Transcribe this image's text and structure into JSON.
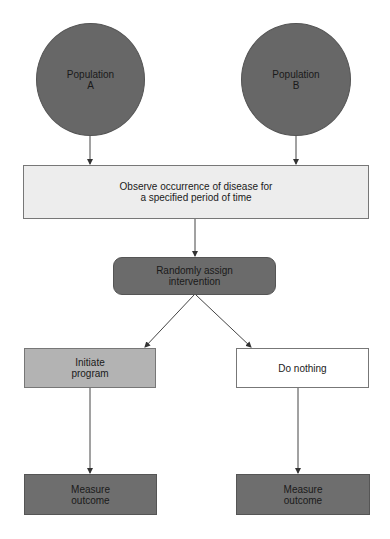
{
  "diagram": {
    "nodes": {
      "population_a": {
        "label": "Population\nA"
      },
      "population_b": {
        "label": "Population\nB"
      },
      "observe": {
        "label": "Observe occurrence of disease for\na specified period of time"
      },
      "randomize": {
        "label": "Randomly assign\nintervention"
      },
      "initiate": {
        "label": "Initiate\nprogram"
      },
      "do_nothing": {
        "label": "Do nothing"
      },
      "measure_left": {
        "label": "Measure\noutcome"
      },
      "measure_right": {
        "label": "Measure\noutcome"
      }
    },
    "edges": [
      {
        "from": "population_a",
        "to": "observe"
      },
      {
        "from": "population_b",
        "to": "observe"
      },
      {
        "from": "observe",
        "to": "randomize"
      },
      {
        "from": "randomize",
        "to": "initiate"
      },
      {
        "from": "randomize",
        "to": "do_nothing"
      },
      {
        "from": "initiate",
        "to": "measure_left"
      },
      {
        "from": "do_nothing",
        "to": "measure_right"
      }
    ],
    "colors": {
      "circle_fill": "#676767",
      "observe_fill": "#ededed",
      "randomize_fill": "#6b6b6b",
      "initiate_fill": "#b3b3b3",
      "do_nothing_fill": "#ffffff",
      "measure_fill": "#6e6e6e",
      "edge": "#333333"
    }
  }
}
